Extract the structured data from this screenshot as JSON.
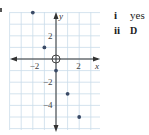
{
  "chart_data": {
    "type": "scatter",
    "title": "",
    "xlabel": "x",
    "ylabel": "y",
    "xlim": [
      -4,
      4
    ],
    "ylim": [
      -6,
      4.5
    ],
    "grid": true,
    "x_ticks": [
      {
        "value": -2,
        "label": "−2"
      },
      {
        "value": 2,
        "label": "2"
      }
    ],
    "y_ticks": [
      {
        "value": 2,
        "label": "2"
      },
      {
        "value": -2,
        "label": "−2"
      },
      {
        "value": -4,
        "label": "−4"
      }
    ],
    "origin_marker": "O",
    "points": [
      {
        "x": -2,
        "y": 4
      },
      {
        "x": -1,
        "y": 1
      },
      {
        "x": 0,
        "y": -1
      },
      {
        "x": 1,
        "y": -3
      },
      {
        "x": 2,
        "y": -5
      }
    ],
    "colors": {
      "grid": "#c9dcea",
      "axis": "#333333",
      "point": "#3a4a66"
    }
  },
  "answers": [
    {
      "number": "i",
      "text": "yes"
    },
    {
      "number": "ii",
      "text": "D"
    }
  ]
}
